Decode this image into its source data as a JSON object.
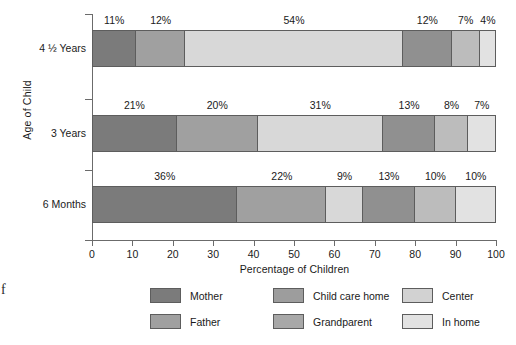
{
  "chart_data": {
    "type": "bar",
    "orientation": "horizontal",
    "stacked": true,
    "title": "",
    "xlabel": "Percentage of Children",
    "ylabel": "Age of Child",
    "xlim": [
      0,
      100
    ],
    "xticks": [
      0,
      10,
      20,
      30,
      40,
      50,
      60,
      70,
      80,
      90,
      100
    ],
    "xtick_labels": [
      "0",
      "10",
      "20",
      "30",
      "40",
      "50",
      "60",
      "70",
      "80",
      "90",
      "100"
    ],
    "grid": false,
    "legend_position": "bottom",
    "categories": [
      "4 ½ Years",
      "3 Years",
      "6 Months"
    ],
    "series": [
      {
        "name": "Mother",
        "color": "#7b7b7b",
        "values": [
          11,
          21,
          36
        ]
      },
      {
        "name": "Father",
        "color": "#a0a0a0",
        "values": [
          12,
          20,
          22
        ]
      },
      {
        "name": "Child care home",
        "color": "#d8d8d8",
        "values": [
          54,
          31,
          9
        ]
      },
      {
        "name": "Grandparent",
        "color": "#909090",
        "values": [
          12,
          13,
          13
        ]
      },
      {
        "name": "Center",
        "color": "#bcbcbc",
        "values": [
          7,
          8,
          10
        ]
      },
      {
        "name": "In home",
        "color": "#e2e2e2",
        "values": [
          4,
          7,
          10
        ]
      }
    ],
    "bar_labels": [
      [
        "11%",
        "12%",
        "54%",
        "12%",
        "7%",
        "4%"
      ],
      [
        "21%",
        "20%",
        "31%",
        "13%",
        "8%",
        "7%"
      ],
      [
        "36%",
        "22%",
        "9%",
        "13%",
        "10%",
        "10%"
      ]
    ]
  },
  "legend": {
    "entries": [
      {
        "label": "Mother",
        "color": "#7b7b7b"
      },
      {
        "label": "Father",
        "color": "#a0a0a0"
      },
      {
        "label": "Child care home",
        "color": "#9d9d9d"
      },
      {
        "label": "Grandparent",
        "color": "#a8a8a8"
      },
      {
        "label": "Center",
        "color": "#d2d2d2"
      },
      {
        "label": "In home",
        "color": "#e2e2e2"
      }
    ]
  },
  "artifact": {
    "glyph": "f"
  }
}
